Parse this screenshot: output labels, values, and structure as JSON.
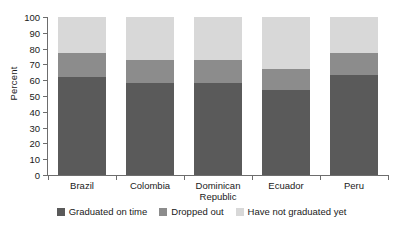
{
  "chart_data": {
    "type": "bar",
    "stacked": true,
    "stack_normalized": true,
    "title": "",
    "xlabel": "",
    "ylabel": "Percent",
    "ylim": [
      0,
      100
    ],
    "yticks": [
      0,
      10,
      20,
      30,
      40,
      50,
      60,
      70,
      80,
      90,
      100
    ],
    "ytick_labels": [
      "0",
      "10",
      "20",
      "30",
      "40",
      "50",
      "60",
      "70",
      "80",
      "90",
      "100"
    ],
    "grid": false,
    "legend_position": "bottom",
    "categories": [
      "Brazil",
      "Colombia",
      "Dominican Republic",
      "Ecuador",
      "Peru"
    ],
    "category_label_lines": [
      [
        "Brazil"
      ],
      [
        "Colombia"
      ],
      [
        "Dominican",
        "Republic"
      ],
      [
        "Ecuador"
      ],
      [
        "Peru"
      ]
    ],
    "series": [
      {
        "name": "Graduated on time",
        "color": "#5a5a5a",
        "values": [
          62,
          58,
          58,
          54,
          63
        ]
      },
      {
        "name": "Dropped out",
        "color": "#8c8c8c",
        "values": [
          15,
          15,
          15,
          13,
          14
        ]
      },
      {
        "name": "Have not graduated yet",
        "color": "#d8d8d8",
        "values": [
          23,
          27,
          27,
          33,
          23
        ]
      }
    ]
  }
}
